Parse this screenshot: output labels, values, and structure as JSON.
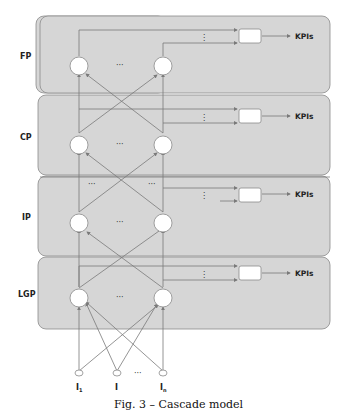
{
  "figure": {
    "caption": "Fig. 3 – Cascade model",
    "colors": {
      "panel_fill": "#d6d6d6",
      "panel_stroke": "#8a8a8a",
      "line": "#7a7a7a",
      "node_fill": "#ffffff"
    },
    "layers": [
      {
        "label": "FP",
        "output": "KPIs",
        "node_dots": "···",
        "vertical_dots": "⋮"
      },
      {
        "label": "CP",
        "output": "KPIs",
        "node_dots": "···",
        "vertical_dots": "⋮"
      },
      {
        "label": "IP",
        "output": "KPIs",
        "node_dots": "···",
        "vertical_dots": "⋮"
      },
      {
        "label": "LGP",
        "output": "KPIs",
        "node_dots": "···",
        "vertical_dots": "⋮"
      }
    ],
    "ip_extra_dots": [
      "···",
      "···"
    ],
    "inputs": [
      {
        "label": "I",
        "sub": "1"
      },
      {
        "label": "I",
        "sub": ""
      },
      {
        "label": "I",
        "sub": "n"
      }
    ],
    "inputs_dots": "···"
  }
}
